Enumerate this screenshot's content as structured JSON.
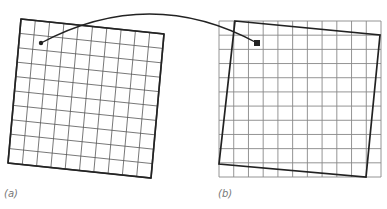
{
  "figure": {
    "panels": [
      {
        "id": "a",
        "label": "(a)",
        "description": "distorted (rotated/skewed) grid with a point marker",
        "corners": {
          "tl": [
            21,
            19
          ],
          "tr": [
            164,
            34
          ],
          "br": [
            151,
            178
          ],
          "bl": [
            8,
            163
          ]
        },
        "divisions": 10,
        "marker": {
          "type": "dot",
          "x": 41,
          "y": 43
        }
      },
      {
        "id": "b",
        "label": "(b)",
        "description": "regular axis-aligned grid with the warped source boundary overlaid",
        "grid": {
          "x0": 219,
          "y0": 21,
          "x1": 381,
          "y1": 177,
          "cols": 11,
          "rows": 11
        },
        "overlay_quad": {
          "tl": [
            235,
            21
          ],
          "tr": [
            380,
            35
          ],
          "br": [
            366,
            177
          ],
          "bl": [
            219,
            164
          ]
        },
        "marker": {
          "type": "square",
          "x": 257,
          "y": 43,
          "size": 6
        }
      }
    ],
    "connector": {
      "from": [
        41,
        43
      ],
      "control": [
        150,
        -15
      ],
      "to": [
        257,
        43
      ]
    },
    "colors": {
      "line": "#222222",
      "grid": "#555555",
      "label": "#777777"
    }
  }
}
